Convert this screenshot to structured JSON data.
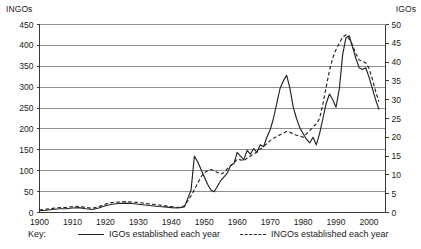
{
  "chart_data": {
    "type": "line",
    "title": "",
    "subtitle": "",
    "xlabel": "",
    "ylabel": "INGOs",
    "y2label": "IGOs",
    "grid": true,
    "legend_position": "bottom",
    "legend_prefix": "Key:",
    "xlim": [
      1900,
      2005
    ],
    "ylim": [
      0,
      450
    ],
    "y2lim": [
      0,
      50
    ],
    "xticks": [
      1900,
      1910,
      1920,
      1930,
      1940,
      1950,
      1960,
      1970,
      1980,
      1990,
      2000
    ],
    "xticklabels": [
      "1900",
      "1910",
      "1920",
      "1930",
      "1940",
      "1950",
      "1960",
      "1970",
      "1980",
      "1990",
      "2000"
    ],
    "yticks": [
      0,
      50,
      100,
      150,
      200,
      250,
      300,
      350,
      400,
      450
    ],
    "yticklabels": [
      "0",
      "50",
      "100",
      "150",
      "200",
      "250",
      "300",
      "350",
      "400",
      "450"
    ],
    "y2ticks": [
      0,
      5,
      10,
      15,
      20,
      25,
      30,
      35,
      40,
      45,
      50
    ],
    "y2ticklabels": [
      "0",
      "5",
      "10",
      "15",
      "20",
      "25",
      "30",
      "35",
      "40",
      "45",
      "50"
    ],
    "series": [
      {
        "name": "IGOs established each year",
        "style": "solid",
        "axis": "right",
        "color": "#242424",
        "x": [
          1900,
          1902,
          1904,
          1906,
          1908,
          1910,
          1912,
          1914,
          1916,
          1918,
          1920,
          1922,
          1924,
          1926,
          1928,
          1930,
          1932,
          1934,
          1936,
          1938,
          1940,
          1942,
          1944,
          1946,
          1947,
          1948,
          1949,
          1950,
          1951,
          1952,
          1953,
          1954,
          1955,
          1956,
          1957,
          1958,
          1959,
          1960,
          1961,
          1962,
          1963,
          1964,
          1965,
          1966,
          1967,
          1968,
          1969,
          1970,
          1971,
          1972,
          1973,
          1974,
          1975,
          1976,
          1977,
          1978,
          1979,
          1980,
          1981,
          1982,
          1983,
          1984,
          1985,
          1986,
          1987,
          1988,
          1989,
          1990,
          1991,
          1992,
          1993,
          1994,
          1995,
          1996,
          1997,
          1998,
          1999,
          2000,
          2001,
          2002,
          2003
        ],
        "values": [
          0.5,
          0.6,
          0.8,
          1.0,
          1.0,
          1.2,
          1.3,
          1.0,
          0.8,
          1.2,
          1.8,
          2.2,
          2.4,
          2.5,
          2.4,
          2.2,
          2.0,
          1.8,
          1.6,
          1.5,
          1.3,
          1.2,
          1.5,
          6.0,
          15.0,
          13.5,
          11.5,
          9.5,
          7.5,
          6.0,
          5.5,
          7.0,
          8.5,
          9.5,
          10.5,
          12.5,
          13.0,
          16.0,
          15.0,
          14.0,
          16.5,
          15.5,
          17.0,
          16.0,
          18.0,
          17.5,
          20.0,
          22.0,
          25.0,
          29.0,
          33.0,
          35.0,
          36.5,
          33.0,
          28.0,
          25.0,
          22.5,
          21.0,
          19.5,
          18.5,
          20.0,
          18.0,
          21.0,
          25.0,
          29.0,
          31.5,
          30.0,
          28.0,
          33.0,
          42.0,
          46.5,
          47.0,
          44.0,
          41.0,
          38.5,
          38.0,
          38.5,
          36.0,
          33.0,
          30.0,
          27.5
        ]
      },
      {
        "name": "INGOs established each year",
        "style": "dashed",
        "axis": "left",
        "color": "#242424",
        "x": [
          1900,
          1902,
          1904,
          1906,
          1908,
          1910,
          1912,
          1914,
          1916,
          1918,
          1920,
          1922,
          1924,
          1926,
          1928,
          1930,
          1932,
          1934,
          1936,
          1938,
          1940,
          1942,
          1944,
          1946,
          1947,
          1948,
          1949,
          1950,
          1951,
          1952,
          1953,
          1954,
          1955,
          1956,
          1957,
          1958,
          1959,
          1960,
          1961,
          1962,
          1963,
          1964,
          1965,
          1966,
          1967,
          1968,
          1969,
          1970,
          1971,
          1972,
          1973,
          1974,
          1975,
          1976,
          1977,
          1978,
          1979,
          1980,
          1981,
          1982,
          1983,
          1984,
          1985,
          1986,
          1987,
          1988,
          1989,
          1990,
          1991,
          1992,
          1993,
          1994,
          1995,
          1996,
          1997,
          1998,
          1999,
          2000,
          2001,
          2002,
          2003
        ],
        "values": [
          6,
          8,
          10,
          12,
          12,
          14,
          15,
          12,
          10,
          14,
          20,
          24,
          25,
          26,
          25,
          24,
          22,
          20,
          18,
          16,
          14,
          12,
          16,
          40,
          55,
          70,
          85,
          95,
          100,
          103,
          100,
          96,
          92,
          96,
          105,
          112,
          118,
          128,
          126,
          124,
          130,
          135,
          140,
          145,
          152,
          158,
          165,
          172,
          178,
          182,
          186,
          190,
          194,
          192,
          188,
          185,
          183,
          180,
          188,
          196,
          205,
          212,
          225,
          260,
          300,
          340,
          370,
          390,
          405,
          420,
          425,
          415,
          400,
          380,
          365,
          362,
          358,
          345,
          320,
          290,
          265
        ]
      }
    ]
  },
  "legend": {
    "key_label": "Key:",
    "items": [
      {
        "label": "IGOs established each year",
        "style": "solid"
      },
      {
        "label": "INGOs established each year",
        "style": "dashed"
      }
    ]
  },
  "axes": {
    "left_title": "INGOs",
    "right_title": "IGOs"
  }
}
